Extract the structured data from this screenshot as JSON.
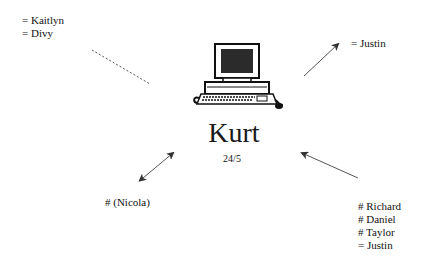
{
  "center": {
    "name": "Kurt",
    "date": "24/5",
    "icon": "computer-icon"
  },
  "groups": {
    "top_left": {
      "lines": [
        "= Kaitlyn",
        "= Divy"
      ],
      "connector": "dashed-line"
    },
    "top_right": {
      "lines": [
        "= Justin"
      ],
      "connector": "arrow-outward"
    },
    "bottom_left": {
      "lines": [
        "# (Nicola)"
      ],
      "connector": "double-arrow"
    },
    "bottom_right": {
      "lines": [
        "# Richard",
        "# Daniel",
        "# Taylor",
        "= Justin"
      ],
      "connector": "arrow-inward"
    }
  },
  "colors": {
    "ink": "#111111",
    "line": "#555555",
    "screen": "#2b2b2b"
  }
}
